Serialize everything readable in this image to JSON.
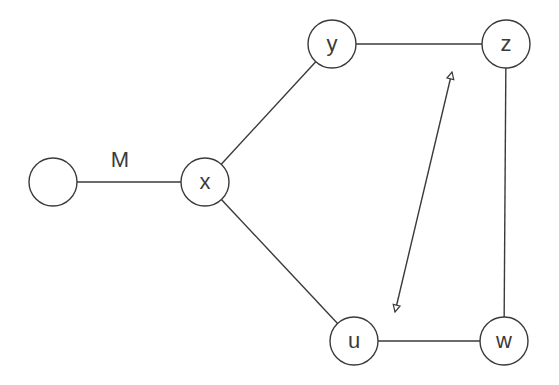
{
  "diagram": {
    "type": "graph",
    "nodes": [
      {
        "id": "n0",
        "label": "",
        "cx": 53,
        "cy": 182,
        "r": 24
      },
      {
        "id": "x",
        "label": "x",
        "cx": 205,
        "cy": 182,
        "r": 24
      },
      {
        "id": "y",
        "label": "y",
        "cx": 332,
        "cy": 44,
        "r": 24
      },
      {
        "id": "z",
        "label": "z",
        "cx": 506,
        "cy": 44,
        "r": 24
      },
      {
        "id": "u",
        "label": "u",
        "cx": 354,
        "cy": 341,
        "r": 24
      },
      {
        "id": "w",
        "label": "w",
        "cx": 504,
        "cy": 341,
        "r": 24
      }
    ],
    "edges": [
      {
        "from": "n0",
        "to": "x",
        "label": "M"
      },
      {
        "from": "x",
        "to": "y",
        "label": ""
      },
      {
        "from": "x",
        "to": "u",
        "label": ""
      },
      {
        "from": "y",
        "to": "z",
        "label": ""
      },
      {
        "from": "z",
        "to": "w",
        "label": ""
      },
      {
        "from": "u",
        "to": "w",
        "label": ""
      }
    ],
    "arrow": {
      "type": "double-headed",
      "x1": 395,
      "y1": 312,
      "x2": 452,
      "y2": 72,
      "between": [
        "u",
        "z"
      ]
    },
    "edge_label_M": {
      "text": "M",
      "x": 120,
      "y": 167
    },
    "colors": {
      "stroke": "#3a3a3a",
      "background": "#ffffff"
    }
  }
}
